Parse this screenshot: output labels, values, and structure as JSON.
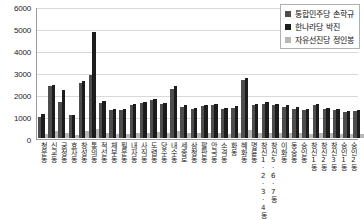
{
  "chart_data": {
    "type": "bar",
    "title": "",
    "xlabel": "",
    "ylabel": "",
    "ylim": [
      0,
      6000
    ],
    "ytick_values": [
      6000,
      5000,
      4000,
      3000,
      2000,
      1000,
      0
    ],
    "ytick_labels": [
      "6000",
      "5000",
      "4000",
      "3000",
      "2000",
      "1000",
      "0"
    ],
    "grid": true,
    "legend_position": "top-right",
    "categories": [
      "청운동",
      "신교동",
      "궁정동",
      "효자동",
      "창성동",
      "통의동",
      "적선동",
      "체부동",
      "필운동",
      "내자동",
      "사직동",
      "도렴동",
      "당주동",
      "내수동",
      "세종로",
      "삼청동",
      "팔판동",
      "안국동",
      "소격동",
      "화동",
      "혜화동",
      "명륜동",
      "창신1·2·3·4동",
      "창신5·6·7동",
      "이화동",
      "동숭동",
      "숭인동",
      "창신1동",
      "창신2동",
      "창신3동",
      "숭인1동",
      "숭인2동"
    ],
    "series": [
      {
        "name": "통합민주당 손학규",
        "color": "#4d4d4d",
        "values": [
          950,
          2380,
          1650,
          1050,
          2520,
          2880,
          1600,
          1280,
          1260,
          1500,
          1580,
          1720,
          1540,
          2250,
          1420,
          1300,
          1450,
          1500,
          1320,
          1380,
          2650,
          1500,
          1560,
          1480,
          1420,
          1340,
          1280,
          1500,
          1320,
          1260,
          1180,
          1220
        ]
      },
      {
        "name": "한나라당 박진",
        "color": "#1c1c1c",
        "values": [
          1080,
          2400,
          2200,
          1050,
          2600,
          4800,
          1680,
          1320,
          1300,
          1560,
          1640,
          1780,
          1600,
          2380,
          1480,
          1360,
          1520,
          1560,
          1380,
          1440,
          2750,
          1560,
          1620,
          1540,
          1480,
          1400,
          1340,
          1560,
          1380,
          1320,
          1240,
          1280
        ]
      },
      {
        "name": "자유선진당 정인봉",
        "color": "#b8b8b8",
        "values": [
          180,
          310,
          240,
          150,
          320,
          430,
          230,
          190,
          200,
          240,
          250,
          270,
          240,
          330,
          220,
          210,
          230,
          240,
          200,
          220,
          380,
          230,
          250,
          230,
          220,
          210,
          200,
          240,
          210,
          200,
          190,
          190
        ]
      }
    ]
  },
  "legend": {
    "items": [
      {
        "label": "통합민주당 손학규",
        "swatch": "s0"
      },
      {
        "label": "한나라당 박진",
        "swatch": "s1"
      },
      {
        "label": "자유선진당 정인봉",
        "swatch": "s2"
      }
    ]
  }
}
